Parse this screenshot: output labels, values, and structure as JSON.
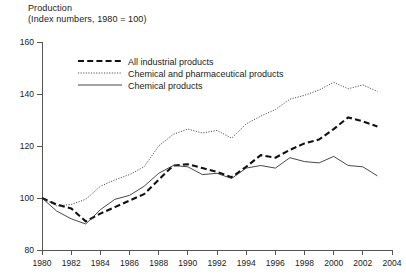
{
  "chart_data": {
    "type": "line",
    "title": "Production",
    "subtitle": "(Index numbers, 1980 = 100)",
    "xlabel": "",
    "ylabel": "",
    "xlim": [
      1980,
      2004
    ],
    "ylim": [
      80,
      160
    ],
    "yticks": [
      80,
      100,
      120,
      140,
      160
    ],
    "xticks": [
      1980,
      1982,
      1984,
      1986,
      1988,
      1990,
      1992,
      1994,
      1996,
      1998,
      2000,
      2002,
      2004
    ],
    "grid": false,
    "legend_position": "top-left-inside",
    "x": [
      1980,
      1981,
      1982,
      1983,
      1984,
      1985,
      1986,
      1987,
      1988,
      1989,
      1990,
      1991,
      1992,
      1993,
      1994,
      1995,
      1996,
      1997,
      1998,
      1999,
      2000,
      2001,
      2002,
      2003
    ],
    "series": [
      {
        "name": "All industrial products",
        "style": "dashed",
        "values": [
          100.0,
          97.5,
          96.0,
          91.0,
          94.0,
          96.5,
          99.0,
          101.5,
          107.0,
          112.5,
          113.0,
          111.5,
          110.0,
          108.0,
          112.0,
          116.5,
          115.5,
          118.5,
          121.0,
          122.5,
          126.5,
          131.0,
          129.5,
          127.5
        ]
      },
      {
        "name": "Chemical and pharmaceutical products",
        "style": "dotted",
        "values": [
          100.0,
          97.0,
          97.5,
          99.5,
          104.5,
          107.0,
          109.0,
          112.0,
          120.0,
          124.5,
          126.5,
          125.0,
          126.0,
          123.0,
          128.5,
          131.5,
          134.0,
          138.0,
          139.5,
          141.5,
          144.5,
          142.0,
          143.5,
          141.0
        ]
      },
      {
        "name": "Chemical products",
        "style": "solid",
        "values": [
          100.0,
          95.0,
          92.0,
          90.0,
          95.5,
          99.5,
          101.0,
          104.5,
          109.5,
          112.5,
          112.0,
          109.0,
          109.5,
          107.5,
          111.5,
          112.5,
          111.5,
          115.5,
          114.0,
          113.5,
          116.0,
          112.5,
          112.0,
          108.5
        ]
      }
    ]
  },
  "legend": {
    "items": [
      {
        "label": "All industrial products"
      },
      {
        "label": "Chemical and pharmaceutical products"
      },
      {
        "label": "Chemical products"
      }
    ]
  },
  "axis": {
    "y_tick_labels": [
      "160",
      "140",
      "120",
      "100",
      "80"
    ],
    "x_tick_labels": [
      "1980",
      "1982",
      "1984",
      "1986",
      "1988",
      "1990",
      "1992",
      "1994",
      "1996",
      "1998",
      "2000",
      "2002",
      "2004"
    ]
  },
  "colors": {
    "axis": "#555555",
    "ink": "#111111",
    "background": "#ffffff"
  }
}
